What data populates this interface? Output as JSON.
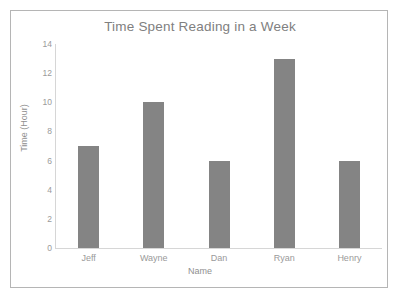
{
  "chart_data": {
    "type": "bar",
    "title": "Time Spent Reading in a Week",
    "xlabel": "Name",
    "ylabel": "Time (Hour)",
    "categories": [
      "Jeff",
      "Wayne",
      "Dan",
      "Ryan",
      "Henry"
    ],
    "values": [
      7,
      10,
      6,
      13,
      6
    ],
    "ylim": [
      0,
      14
    ],
    "yticks": [
      0,
      2,
      4,
      6,
      8,
      10,
      12,
      14
    ],
    "ytick_labels": [
      "0",
      "2",
      "4",
      "6",
      "8",
      "10",
      "12",
      "14"
    ],
    "grid": false,
    "legend": null,
    "bar_color": "#848484",
    "text_color": "#9a9a9a",
    "border_color": "#b5b5b5",
    "background": "#ffffff"
  }
}
